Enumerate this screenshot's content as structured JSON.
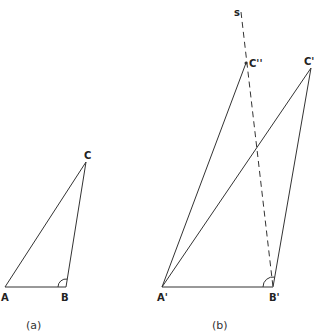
{
  "figure_a": {
    "caption": "(a)",
    "points": {
      "A": {
        "label": "A",
        "x": 5,
        "y": 287
      },
      "B": {
        "label": "B",
        "x": 66,
        "y": 287
      },
      "C": {
        "label": "C",
        "x": 86,
        "y": 162
      }
    }
  },
  "figure_b": {
    "caption": "(b)",
    "points": {
      "A_prime": {
        "label": "A'",
        "x": 162,
        "y": 287
      },
      "B_prime": {
        "label": "B'",
        "x": 273,
        "y": 287
      },
      "C_prime": {
        "label": "C'",
        "x": 311,
        "y": 68
      },
      "C_double_prime": {
        "label": "C''",
        "x": 246,
        "y": 63
      }
    },
    "line_s": {
      "label": "s",
      "from": [
        241,
        12
      ],
      "to": [
        273,
        287
      ],
      "style": "dashed"
    }
  }
}
